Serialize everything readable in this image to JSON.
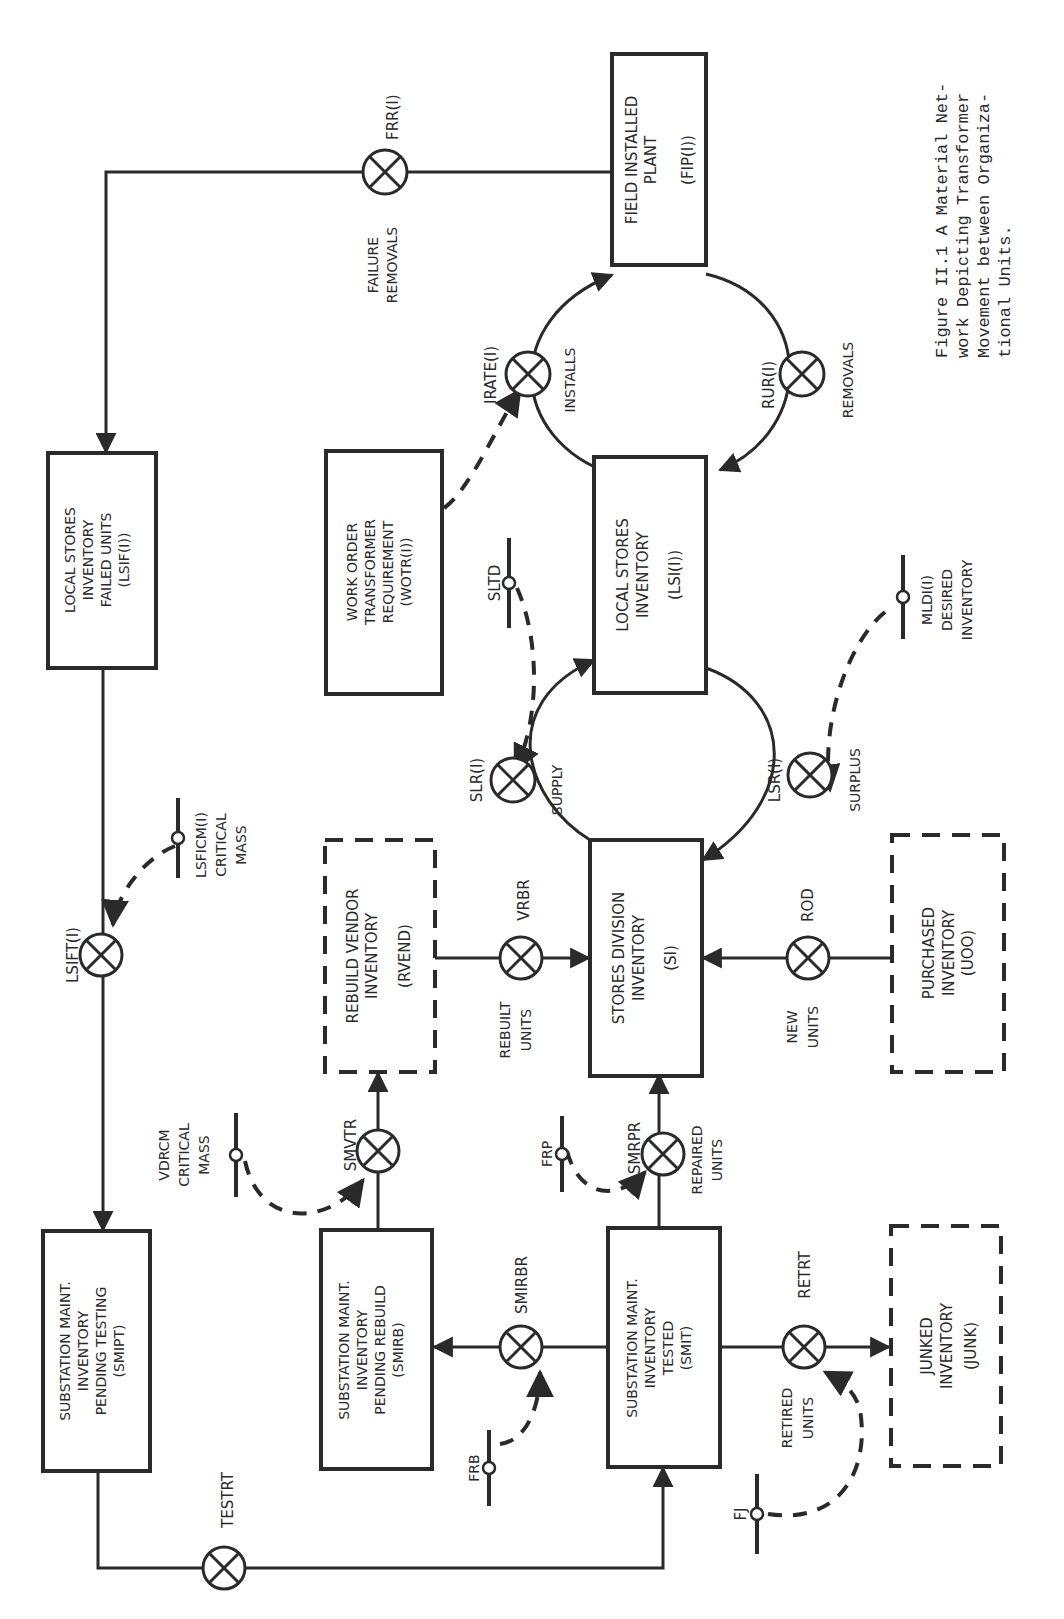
{
  "figure": {
    "caption_lines": [
      "Figure II.1 A Material Net-",
      "work Depicting Transformer",
      "Movement between Organiza-",
      "tional Units."
    ]
  },
  "stocks": {
    "fip": {
      "lines": [
        "FIELD INSTALLED",
        "PLANT",
        "",
        "(FIP(I))"
      ],
      "style": "solid"
    },
    "lsi": {
      "lines": [
        "LOCAL STORES",
        "INVENTORY",
        "",
        "(LSI(I))"
      ],
      "style": "solid"
    },
    "si": {
      "lines": [
        "STORES DIVISION",
        "INVENTORY",
        "",
        "(SI)"
      ],
      "style": "solid"
    },
    "lsif": {
      "lines": [
        "LOCAL STORES",
        "INVENTORY",
        "FAILED UNITS",
        "(LSIF(I))"
      ],
      "style": "solid"
    },
    "wotr": {
      "lines": [
        "WORK ORDER",
        "TRANSFORMER",
        "REQUIREMENT",
        "(WOTR(I))"
      ],
      "style": "solid"
    },
    "rvend": {
      "lines": [
        "REBUILD VENDOR",
        "INVENTORY",
        "",
        "(RVEND)"
      ],
      "style": "dashed"
    },
    "uoo": {
      "lines": [
        "PURCHASED",
        "INVENTORY",
        "(UOO)"
      ],
      "style": "dashed"
    },
    "smipt": {
      "lines": [
        "SUBSTATION MAINT.",
        "INVENTORY",
        "PENDING TESTING",
        "(SMIPT)"
      ],
      "style": "solid"
    },
    "smirb": {
      "lines": [
        "SUBSTATION MAINT.",
        "INVENTORY",
        "PENDING REBUILD",
        "(SMIRB)"
      ],
      "style": "solid"
    },
    "smit": {
      "lines": [
        "SUBSTATION MAINT.",
        "INVENTORY",
        "TESTED",
        "(SMIT)"
      ],
      "style": "solid"
    },
    "junk": {
      "lines": [
        "JUNKED",
        "INVENTORY",
        "(JUNK)"
      ],
      "style": "dashed"
    }
  },
  "rates": {
    "frr": {
      "name": "FRR(I)",
      "desc": [
        "FAILURE",
        "REMOVALS"
      ]
    },
    "irate": {
      "name": "IRATE(I)",
      "desc": [
        "INSTALLS"
      ]
    },
    "rur": {
      "name": "RUR(I)",
      "desc": [
        "REMOVALS"
      ]
    },
    "slr": {
      "name": "SLR(I)",
      "desc": [
        "SUPPLY"
      ]
    },
    "lsr": {
      "name": "LSR(I)",
      "desc": [
        "SURPLUS"
      ]
    },
    "lsift": {
      "name": "LSIFT(I)",
      "desc": []
    },
    "vrbr": {
      "name": "VRBR",
      "desc": [
        "REBUILT",
        "UNITS"
      ]
    },
    "rod": {
      "name": "ROD",
      "desc": [
        "NEW",
        "UNITS"
      ]
    },
    "smvtr": {
      "name": "SMVTR",
      "desc": []
    },
    "smrpr": {
      "name": "SMRPR",
      "desc": [
        "REPAIRED",
        "UNITS"
      ]
    },
    "smirbr": {
      "name": "SMIRBR",
      "desc": []
    },
    "retrt": {
      "name": "RETRT",
      "desc": [
        "RETIRED",
        "UNITS"
      ]
    },
    "testrt": {
      "name": "TESTRT",
      "desc": []
    }
  },
  "auxiliaries": {
    "sltd": {
      "lines": [
        "SLTD"
      ]
    },
    "mldi": {
      "lines": [
        "MLDI(I)",
        "DESIRED",
        "INVENTORY"
      ]
    },
    "lsficm": {
      "lines": [
        "LSFICM(I)",
        "CRITICAL",
        "MASS"
      ]
    },
    "vdrcm": {
      "lines": [
        "VDRCM",
        "CRITICAL",
        "MASS"
      ]
    },
    "frp": {
      "lines": [
        "FRP"
      ]
    },
    "frb": {
      "lines": [
        "FRB"
      ]
    },
    "fj": {
      "lines": [
        "FJ"
      ]
    }
  },
  "colors": {
    "ink": "#2a2a2a",
    "paper": "#ffffff"
  }
}
